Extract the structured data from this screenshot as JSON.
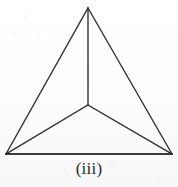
{
  "figure": {
    "caption": "(iii)",
    "stroke_color": "#333333",
    "background_color": "#fdfdfd",
    "caption_color": "#2b2b2b"
  },
  "chart_data": {
    "type": "diagram",
    "title": "(iii)",
    "shape": "triangle-with-central-point",
    "region_count": 3,
    "vertices": [
      {
        "name": "apex",
        "label": "top vertex",
        "x": 88,
        "y": 8
      },
      {
        "name": "bottom-left",
        "label": "bottom left vertex",
        "x": 6,
        "y": 154
      },
      {
        "name": "bottom-right",
        "label": "bottom right vertex",
        "x": 172,
        "y": 154
      },
      {
        "name": "center",
        "label": "interior point",
        "x": 88,
        "y": 105
      }
    ],
    "edges": [
      {
        "name": "left-side",
        "from": "apex",
        "to": "bottom-left"
      },
      {
        "name": "right-side",
        "from": "apex",
        "to": "bottom-right"
      },
      {
        "name": "base",
        "from": "bottom-left",
        "to": "bottom-right"
      },
      {
        "name": "spoke-top",
        "from": "center",
        "to": "apex"
      },
      {
        "name": "spoke-left",
        "from": "center",
        "to": "bottom-left"
      },
      {
        "name": "spoke-right",
        "from": "center",
        "to": "bottom-right"
      }
    ],
    "stroke_width": 1.4
  }
}
